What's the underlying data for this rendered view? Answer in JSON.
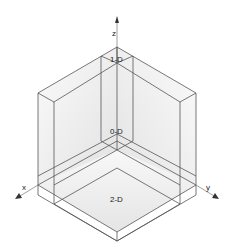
{
  "diagram": {
    "type": "isometric-region-decomposition",
    "axes": {
      "x": {
        "label": "x"
      },
      "y": {
        "label": "y"
      },
      "z": {
        "label": "z"
      }
    },
    "regions": [
      {
        "id": "1d",
        "label": "1-D"
      },
      {
        "id": "0d",
        "label": "0-D"
      },
      {
        "id": "2d",
        "label": "2-D"
      }
    ],
    "colors": {
      "edge": "#555555",
      "face_light": "#f2f2f2",
      "face_mid": "#e4e4e4",
      "face_dark": "#d6d6d6",
      "axis": "#888888"
    }
  }
}
